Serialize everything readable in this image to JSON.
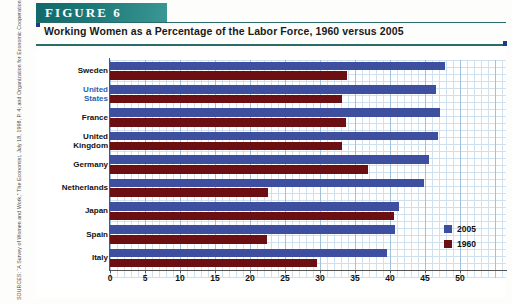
{
  "figure": {
    "banner_label": "FIGURE 6",
    "title": "Working Women as a Percentage of the Labor Force, 1960 versus 2005"
  },
  "source": {
    "text": "SOURCES: “A Survey of Women and Work,” The Economist, July 18, 1998, P. 4; and Organization for Economic Cooperation and Development, Labor Force Statistics, 1983–2005, http://www.sourceoecd.org"
  },
  "legend": {
    "position": "bottom-right",
    "items": [
      {
        "label": "2005",
        "color": "#3e4fa0"
      },
      {
        "label": "1960",
        "color": "#6b0f12"
      }
    ]
  },
  "axis": {
    "xticks": [
      "0",
      "5",
      "10",
      "15",
      "20",
      "25",
      "30",
      "35",
      "40",
      "45",
      "50"
    ]
  },
  "chart_data": {
    "type": "bar",
    "orientation": "horizontal",
    "title": "Working Women as a Percentage of the Labor Force, 1960 versus 2005",
    "xlabel": "",
    "ylabel": "",
    "xlim": [
      0,
      52
    ],
    "grid": true,
    "legend_position": "bottom-right",
    "categories": [
      "Sweden",
      "United States",
      "France",
      "United Kingdom",
      "Germany",
      "Netherlands",
      "Japan",
      "Spain",
      "Italy"
    ],
    "series": [
      {
        "name": "2005",
        "color": "#3e4fa0",
        "values": [
          47.8,
          46.6,
          47.2,
          46.8,
          45.5,
          44.8,
          41.3,
          40.7,
          39.6
        ]
      },
      {
        "name": "1960",
        "color": "#6b0f12",
        "values": [
          33.8,
          33.2,
          33.7,
          33.2,
          36.9,
          22.6,
          40.6,
          22.4,
          29.5
        ]
      }
    ]
  },
  "rows": [
    {
      "label_line1": "Sweden",
      "label_line2": "",
      "highlight": false
    },
    {
      "label_line1": "United",
      "label_line2": "States",
      "highlight": true
    },
    {
      "label_line1": "France",
      "label_line2": "",
      "highlight": false
    },
    {
      "label_line1": "United",
      "label_line2": "Kingdom",
      "highlight": false
    },
    {
      "label_line1": "Germany",
      "label_line2": "",
      "highlight": false
    },
    {
      "label_line1": "Netherlands",
      "label_line2": "",
      "highlight": false
    },
    {
      "label_line1": "Japan",
      "label_line2": "",
      "highlight": false
    },
    {
      "label_line1": "Spain",
      "label_line2": "",
      "highlight": false
    },
    {
      "label_line1": "Italy",
      "label_line2": "",
      "highlight": false
    }
  ]
}
